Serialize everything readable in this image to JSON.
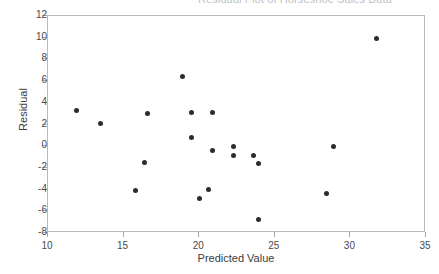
{
  "chart_data": {
    "type": "scatter",
    "title": "Residual Plot of Horseshoe Sales Data",
    "xlabel": "Predicted Value",
    "ylabel": "Residual",
    "xlim": [
      10,
      35
    ],
    "ylim": [
      -8,
      12
    ],
    "xticks": [
      10,
      15,
      20,
      25,
      30,
      35
    ],
    "yticks": [
      -8,
      -6,
      -4,
      -2,
      0,
      2,
      4,
      6,
      8,
      10,
      12
    ],
    "grid": false,
    "legend": null,
    "marker": "filled-circle",
    "marker_color": "#2c2c30",
    "points": [
      {
        "x": 11.9,
        "y": 3.3
      },
      {
        "x": 13.5,
        "y": 2.1
      },
      {
        "x": 15.8,
        "y": -4.1
      },
      {
        "x": 16.4,
        "y": -1.5
      },
      {
        "x": 16.6,
        "y": 3.0
      },
      {
        "x": 18.9,
        "y": 6.4
      },
      {
        "x": 19.5,
        "y": 0.8
      },
      {
        "x": 19.5,
        "y": 3.1
      },
      {
        "x": 20.0,
        "y": -4.8
      },
      {
        "x": 20.6,
        "y": -4.0
      },
      {
        "x": 20.9,
        "y": 3.1
      },
      {
        "x": 20.9,
        "y": -0.4
      },
      {
        "x": 22.3,
        "y": 0.0
      },
      {
        "x": 22.3,
        "y": -0.9
      },
      {
        "x": 23.6,
        "y": -0.9
      },
      {
        "x": 23.9,
        "y": -1.6
      },
      {
        "x": 23.9,
        "y": -6.8
      },
      {
        "x": 28.4,
        "y": -4.4
      },
      {
        "x": 28.9,
        "y": 0.0
      },
      {
        "x": 31.7,
        "y": 9.9
      }
    ]
  }
}
